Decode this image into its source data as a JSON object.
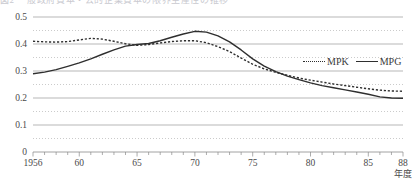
{
  "caption": {
    "clipped_text": "図2 一般政府資本・公的企業資本の限界生産性の推移"
  },
  "legend": {
    "position": "inside-top-right",
    "entries": [
      {
        "label": "MPK",
        "style": "dotted",
        "icon": "dotted-line-swatch"
      },
      {
        "label": "MPG",
        "style": "solid",
        "icon": "solid-line-swatch"
      }
    ]
  },
  "axes": {
    "x_unit_label": "年度",
    "y_tick_labels": [
      "0.5",
      "0.4",
      "0.3",
      "0.2",
      "0.1",
      "0"
    ],
    "x_tick_labels": [
      "1956",
      "60",
      "65",
      "70",
      "75",
      "80",
      "85",
      "88"
    ]
  },
  "chart_data": {
    "type": "line",
    "title": "",
    "subtitle": "",
    "xlabel": "年度",
    "ylabel": "",
    "xlim": [
      1956,
      1988
    ],
    "ylim": [
      0,
      0.5
    ],
    "yticks": [
      0,
      0.1,
      0.2,
      0.3,
      0.4,
      0.5
    ],
    "xticks": [
      1956,
      1960,
      1965,
      1970,
      1975,
      1980,
      1985,
      1988
    ],
    "xtick_labels": [
      "1956",
      "60",
      "65",
      "70",
      "75",
      "80",
      "85",
      "88"
    ],
    "grid": "horizontal-major-and-minor",
    "legend_position": "upper right inside",
    "x": [
      1956,
      1957,
      1958,
      1959,
      1960,
      1961,
      1962,
      1963,
      1964,
      1965,
      1966,
      1967,
      1968,
      1969,
      1970,
      1971,
      1972,
      1973,
      1974,
      1975,
      1976,
      1977,
      1978,
      1979,
      1980,
      1981,
      1982,
      1983,
      1984,
      1985,
      1986,
      1987,
      1988
    ],
    "series": [
      {
        "name": "MPK",
        "style": "dotted",
        "color": "#2f2f2f",
        "values": [
          0.41,
          0.408,
          0.407,
          0.409,
          0.415,
          0.421,
          0.418,
          0.41,
          0.401,
          0.395,
          0.398,
          0.404,
          0.409,
          0.412,
          0.412,
          0.405,
          0.39,
          0.372,
          0.348,
          0.325,
          0.308,
          0.295,
          0.284,
          0.274,
          0.266,
          0.259,
          0.252,
          0.246,
          0.24,
          0.234,
          0.229,
          0.226,
          0.225
        ]
      },
      {
        "name": "MPG",
        "style": "solid",
        "color": "#2f2f2f",
        "values": [
          0.29,
          0.296,
          0.305,
          0.317,
          0.33,
          0.345,
          0.362,
          0.378,
          0.392,
          0.398,
          0.402,
          0.412,
          0.425,
          0.437,
          0.447,
          0.444,
          0.43,
          0.408,
          0.378,
          0.345,
          0.318,
          0.298,
          0.281,
          0.268,
          0.256,
          0.246,
          0.238,
          0.23,
          0.222,
          0.214,
          0.204,
          0.2,
          0.199
        ]
      }
    ]
  }
}
